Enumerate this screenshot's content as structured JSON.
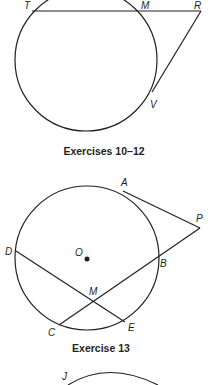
{
  "figure1": {
    "caption": "Exercises 10–12",
    "labels": {
      "T": "T",
      "M": "M",
      "R": "R",
      "V": "V"
    }
  },
  "figure2": {
    "caption": "Exercise 13",
    "labels": {
      "A": "A",
      "P": "P",
      "O": "O",
      "B": "B",
      "D": "D",
      "M": "M",
      "C": "C",
      "E": "E"
    }
  },
  "figure3": {
    "labels": {
      "J": "J"
    }
  },
  "colors": {
    "ink": "#231f20",
    "background": "#ffffff"
  }
}
